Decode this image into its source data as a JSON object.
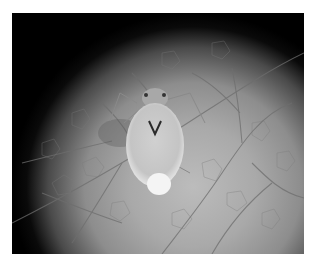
{
  "figure": {
    "colors": {
      "background": "#ffffff",
      "vignette": "#000000",
      "leaf_light": "#bcbcbc",
      "leaf_mid": "#8d8d8d",
      "vein": "#6a6a6a",
      "aphid_body": "#e4e4e4"
    }
  },
  "caption": {
    "text": ""
  }
}
